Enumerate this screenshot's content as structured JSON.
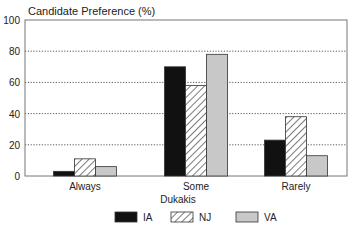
{
  "chart_data": {
    "type": "bar",
    "title": "Candidate Preference (%)",
    "xlabel": "Dukakis",
    "ylabel": "Candidate Preference (%)",
    "ylim": [
      0,
      100
    ],
    "yticks": [
      0,
      20,
      40,
      60,
      80,
      100
    ],
    "grid": "horizontal dotted",
    "legend_position": "bottom",
    "categories": [
      "Always",
      "Some",
      "Rarely"
    ],
    "series": [
      {
        "name": "IA",
        "style": "solid black",
        "color": "#111111",
        "values": [
          3,
          70,
          23
        ]
      },
      {
        "name": "NJ",
        "style": "diagonal hatch",
        "color": "#ffffff",
        "values": [
          11,
          58,
          38
        ]
      },
      {
        "name": "VA",
        "style": "light gray",
        "color": "#c8c8c8",
        "values": [
          6,
          78,
          13
        ]
      }
    ]
  }
}
